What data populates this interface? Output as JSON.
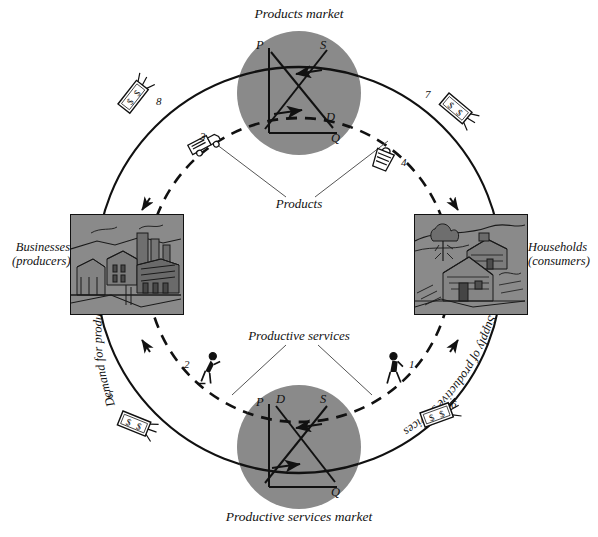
{
  "figure": {
    "title_top": "Products market",
    "title_bottom": "Productive services market",
    "background_color": "#ffffff",
    "ink_color": "#111111",
    "market_circle_color": "#8a8a8a",
    "photo_box_color": "#8a8a8a"
  },
  "markets": {
    "products": {
      "label": "Products market",
      "axis_price": "P",
      "axis_quantity": "Q",
      "curve_supply": "S",
      "curve_demand": "D"
    },
    "productive_services": {
      "label": "Productive services market",
      "axis_price": "P",
      "axis_quantity": "Q",
      "curve_supply": "S",
      "curve_demand": "D"
    }
  },
  "sectors": {
    "businesses": {
      "line1": "Businesses",
      "line2": "(producers)",
      "image_name": "industrial-cityscape-illustration"
    },
    "households": {
      "line1": "Households",
      "line2": "(consumers)",
      "image_name": "rural-houses-illustration"
    }
  },
  "flow_labels": {
    "products": "Products",
    "productive_services": "Productive services",
    "demand_curved": "Demand for productive services",
    "supply_curved": "Supply of productive services"
  },
  "callouts": [
    {
      "number": "1",
      "icon": "worker-walking-icon",
      "meaning": "supply of productive services from households"
    },
    {
      "number": "2",
      "icon": "worker-laboring-icon",
      "meaning": "productive services received by businesses"
    },
    {
      "number": "3",
      "icon": "delivery-truck-icon",
      "meaning": "products shipped from businesses"
    },
    {
      "number": "4",
      "icon": "shopping-bag-icon",
      "meaning": "products received by households"
    },
    {
      "number": "5",
      "icon": "banknote-icon",
      "meaning": "money paid by businesses for productive services"
    },
    {
      "number": "6",
      "icon": "banknote-icon",
      "meaning": "money income received by households"
    },
    {
      "number": "7",
      "icon": "banknote-icon",
      "meaning": "money spent by households on products"
    },
    {
      "number": "8",
      "icon": "banknote-icon",
      "meaning": "money revenue received by businesses"
    }
  ],
  "money_note": "$",
  "legend_flow": {
    "solid": "money flow (outer solid circle)",
    "dashed": "real goods and services flow (inner dashed circle)"
  }
}
